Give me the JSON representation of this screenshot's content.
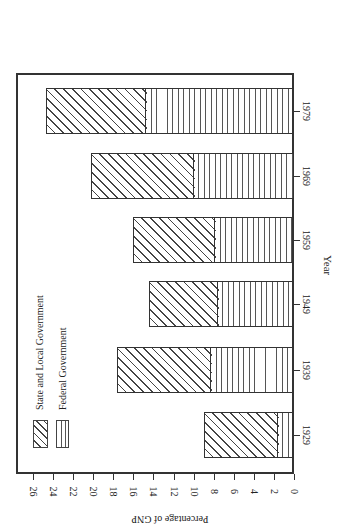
{
  "chart_data": {
    "type": "bar",
    "stacked": true,
    "orientation": "rotated-90-ccw",
    "title": "",
    "xlabel": "Year",
    "ylabel": "Percentage of GNP",
    "categories": [
      "1929",
      "1939",
      "1949",
      "1959",
      "1969",
      "1979"
    ],
    "series": [
      {
        "name": "Federal Government",
        "pattern": "vertical-lines",
        "values": [
          1.6,
          8.3,
          7.6,
          7.9,
          10.0,
          14.7
        ]
      },
      {
        "name": "State and Local Government",
        "pattern": "diagonal-hatch",
        "values": [
          7.4,
          9.3,
          6.8,
          8.1,
          10.2,
          10.0
        ]
      }
    ],
    "totals": [
      9.0,
      17.6,
      14.4,
      16.0,
      20.2,
      24.7
    ],
    "ylim": [
      0,
      27
    ],
    "yticks": [
      "0",
      "2",
      "4",
      "6",
      "8",
      "10",
      "12",
      "14",
      "16",
      "18",
      "20",
      "22",
      "24",
      "26"
    ],
    "grid": false,
    "legend_position": "upper-left (inside plot)"
  },
  "legend": {
    "state_label": "State and Local Government",
    "federal_label": "Federal Government"
  },
  "axes": {
    "x_title": "Year",
    "y_title": "Percentage of GNP"
  }
}
